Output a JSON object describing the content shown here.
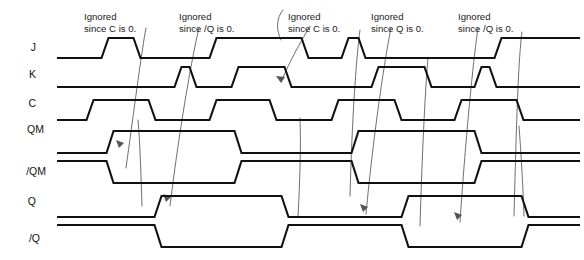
{
  "figure": {
    "kind": "timing-diagram",
    "width": 584,
    "height": 260,
    "background": "#ffffff",
    "wave_color": "#111111",
    "leader_color": "#555555",
    "text_color": "#1a1a1a"
  },
  "signals": [
    {
      "id": "J",
      "label": "J",
      "label_x": 36,
      "label_y": 48,
      "low_y": 58,
      "high_y": 38
    },
    {
      "id": "K",
      "label": "K",
      "label_x": 36,
      "label_y": 75,
      "low_y": 87,
      "high_y": 67
    },
    {
      "id": "C",
      "label": "C",
      "label_x": 36,
      "label_y": 104,
      "low_y": 120,
      "high_y": 100
    },
    {
      "id": "QM",
      "label": "QM",
      "label_x": 44,
      "label_y": 130,
      "low_y": 153,
      "high_y": 131
    },
    {
      "id": "nQM",
      "label": "/QM",
      "label_x": 46,
      "label_y": 172,
      "low_y": 183,
      "high_y": 161
    },
    {
      "id": "Q",
      "label": "Q",
      "label_x": 36,
      "label_y": 202,
      "low_y": 217,
      "high_y": 196
    },
    {
      "id": "nQ",
      "label": "/Q",
      "label_x": 40,
      "label_y": 239,
      "low_y": 247,
      "high_y": 225
    }
  ],
  "waveforms": {
    "J": {
      "start_level": 0,
      "start_x": 57,
      "end_x": 580,
      "edges": [
        {
          "x": 105,
          "to": 1
        },
        {
          "x": 137,
          "to": 0
        },
        {
          "x": 213,
          "to": 1
        },
        {
          "x": 305,
          "to": 0
        },
        {
          "x": 345,
          "to": 1
        },
        {
          "x": 362,
          "to": 0
        },
        {
          "x": 498,
          "to": 1
        }
      ]
    },
    "K": {
      "start_level": 0,
      "start_x": 57,
      "end_x": 580,
      "edges": [
        {
          "x": 178,
          "to": 1
        },
        {
          "x": 193,
          "to": 0
        },
        {
          "x": 235,
          "to": 1
        },
        {
          "x": 288,
          "to": 0
        },
        {
          "x": 375,
          "to": 1
        },
        {
          "x": 428,
          "to": 0
        },
        {
          "x": 478,
          "to": 1
        },
        {
          "x": 493,
          "to": 0
        }
      ]
    },
    "C": {
      "start_level": 0,
      "start_x": 57,
      "end_x": 580,
      "edges": [
        {
          "x": 90,
          "to": 1
        },
        {
          "x": 152,
          "to": 0
        },
        {
          "x": 213,
          "to": 1
        },
        {
          "x": 273,
          "to": 0
        },
        {
          "x": 335,
          "to": 1
        },
        {
          "x": 398,
          "to": 0
        },
        {
          "x": 458,
          "to": 1
        },
        {
          "x": 520,
          "to": 0
        }
      ]
    },
    "QM": {
      "start_level": 0,
      "start_x": 57,
      "end_x": 580,
      "edges": [
        {
          "x": 110,
          "to": 1
        },
        {
          "x": 238,
          "to": 0
        },
        {
          "x": 355,
          "to": 1
        },
        {
          "x": 478,
          "to": 0
        }
      ]
    },
    "nQM": {
      "start_level": 1,
      "start_x": 57,
      "end_x": 580,
      "edges": [
        {
          "x": 110,
          "to": 0
        },
        {
          "x": 238,
          "to": 1
        },
        {
          "x": 355,
          "to": 0
        },
        {
          "x": 478,
          "to": 1
        }
      ]
    },
    "Q": {
      "start_level": 0,
      "start_x": 57,
      "end_x": 580,
      "edges": [
        {
          "x": 158,
          "to": 1
        },
        {
          "x": 285,
          "to": 0
        },
        {
          "x": 405,
          "to": 1
        },
        {
          "x": 525,
          "to": 0
        }
      ]
    },
    "nQ": {
      "start_level": 1,
      "start_x": 57,
      "end_x": 580,
      "edges": [
        {
          "x": 158,
          "to": 0
        },
        {
          "x": 285,
          "to": 1
        },
        {
          "x": 405,
          "to": 0
        },
        {
          "x": 525,
          "to": 1
        }
      ]
    }
  },
  "annotations": [
    {
      "id": "ann-1",
      "line1": "Ignored",
      "line2": "since C is 0.",
      "x": 84,
      "y1": 12,
      "y2": 24,
      "leader": "M 146 28 C 142 48, 133 118, 126 168"
    },
    {
      "id": "ann-2",
      "line1": "Ignored",
      "line2": "since /Q is 0.",
      "x": 179,
      "y1": 12,
      "y2": 24,
      "leader": "M 199 28 C 193 52, 180 124, 170 206"
    },
    {
      "id": "ann-3",
      "line1": "Ignored",
      "line2": "since C is 0.",
      "x": 288,
      "y1": 12,
      "y2": 24,
      "leader": "M 283 10 C 276 18, 276 30, 281 40"
    },
    {
      "id": "ann-4",
      "line1": "Ignored",
      "line2": "since Q is 0.",
      "x": 371,
      "y1": 12,
      "y2": 24,
      "leader": "M 391 28 C 386 52, 374 128, 366 214"
    },
    {
      "id": "ann-5",
      "line1": "Ignored",
      "line2": "since /Q is 0.",
      "x": 458,
      "y1": 12,
      "y2": 24,
      "leader": "M 478 28 C 474 54, 466 132, 460 222"
    }
  ],
  "extra_leaders": [
    {
      "id": "leader-c1-a",
      "path": "M 138 120 C 140 142, 141 176, 142 206"
    },
    {
      "id": "leader-c1-b",
      "path": "M 310 26 C 302 40, 290 60, 282 80"
    },
    {
      "id": "leader-c2",
      "path": "M 300 118 C 301 142, 300 180, 298 216"
    },
    {
      "id": "leader-c3",
      "path": "M 360 30 C 356 60, 352 120, 350 196"
    },
    {
      "id": "leader-c4",
      "path": "M 522 32 C 518 60, 516 140, 514 216"
    },
    {
      "id": "leader-c5",
      "path": "M 428 58 C 425 92, 422 158, 420 226"
    },
    {
      "id": "leader-c6",
      "path": "M 519 126 C 521 152, 523 186, 524 216"
    }
  ],
  "arrowheads": [
    {
      "id": "arrow-1",
      "path": "M 116 140 l 8 3 l -5 5 z"
    },
    {
      "id": "arrow-2",
      "path": "M 163 194 l 8 3 l -5 5 z"
    },
    {
      "id": "arrow-3",
      "path": "M 276 76 l 9 1 l -4 6 z"
    },
    {
      "id": "arrow-4",
      "path": "M 360 204 l 8 3 l -5 5 z"
    },
    {
      "id": "arrow-5",
      "path": "M 454 212 l 8 3 l -5 5 z"
    }
  ]
}
